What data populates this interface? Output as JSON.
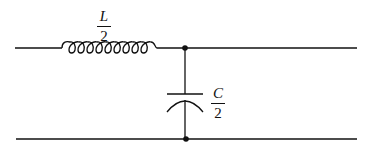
{
  "diagram": {
    "type": "LC filter section (T/half-section)",
    "inductor": {
      "label_numerator": "L",
      "label_denominator": "2"
    },
    "capacitor": {
      "label_numerator": "C",
      "label_denominator": "2"
    },
    "colors": {
      "stroke": "#111111",
      "background": "#ffffff"
    }
  }
}
